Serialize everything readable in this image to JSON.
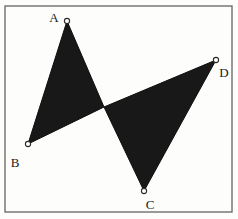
{
  "figure": {
    "background_color": "#fdfdfc",
    "frame": {
      "name": "figure-border",
      "x": 5,
      "y": 6,
      "width": 227,
      "height": 206,
      "stroke_color": "#6e6e6e",
      "stroke_width": 1.4
    },
    "fill_color": "#181818",
    "edge_color": "#0d0d0d",
    "marker": {
      "radius": 2.6,
      "stroke_color": "#2b2b2b",
      "fill_color": "#ffffff"
    },
    "points": [
      {
        "id": "A",
        "label": "A",
        "x": 67,
        "y": 21,
        "label_x": 54,
        "label_y": 22
      },
      {
        "id": "B",
        "label": "B",
        "x": 28,
        "y": 144,
        "label_x": 15,
        "label_y": 167
      },
      {
        "id": "C",
        "label": "C",
        "x": 144,
        "y": 191,
        "label_x": 150,
        "label_y": 209
      },
      {
        "id": "D",
        "label": "D",
        "x": 216,
        "y": 60,
        "label_x": 224,
        "label_y": 77
      },
      {
        "id": "O",
        "label": "",
        "x": 104,
        "y": 107,
        "label_x": 104,
        "label_y": 107
      }
    ],
    "triangles": [
      {
        "name": "left-triangle",
        "vertices": "A,B,O",
        "polygon": "67,21 28,144 104,107"
      },
      {
        "name": "right-triangle",
        "vertices": "O,D,C",
        "polygon": "104,107 216,60 144,191"
      }
    ]
  }
}
